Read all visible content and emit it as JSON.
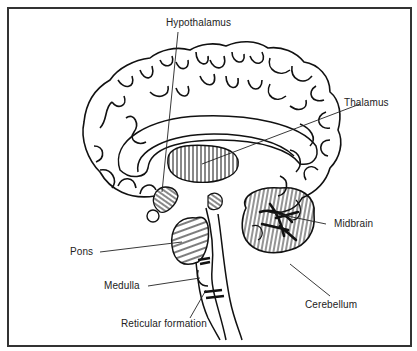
{
  "diagram": {
    "labels": {
      "hypothalamus": "Hypothalamus",
      "thalamus": "Thalamus",
      "midbrain": "Midbrain",
      "pons": "Pons",
      "medulla": "Medulla",
      "cerebellum": "Cerebellum",
      "reticular_formation": "Reticular formation"
    },
    "colors": {
      "line": "#111111",
      "frame": "#333333",
      "background": "#ffffff"
    }
  }
}
